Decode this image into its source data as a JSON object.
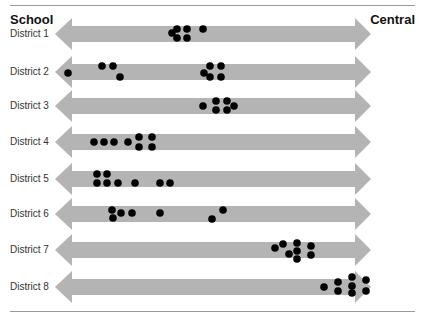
{
  "header": {
    "left_label": "School",
    "right_label": "Central"
  },
  "colors": {
    "arrow": "#b4b4b4",
    "dot": "#000000",
    "rule": "#9a9a9a"
  },
  "rows": [
    {
      "label": "District 1"
    },
    {
      "label": "District 2"
    },
    {
      "label": "District 3"
    },
    {
      "label": "District 4"
    },
    {
      "label": "District 5"
    },
    {
      "label": "District 6"
    },
    {
      "label": "District 7"
    },
    {
      "label": "District 8"
    }
  ],
  "chart_data": {
    "type": "scatter",
    "title": "",
    "xlabel": "School ← → Central",
    "ylabel": "",
    "axis_ends": {
      "left": "School",
      "right": "Central"
    },
    "categories": [
      "District 1",
      "District 2",
      "District 3",
      "District 4",
      "District 5",
      "District 6",
      "District 7",
      "District 8"
    ],
    "x_scale_note": "Position along School (0) to Central (100) continuum, estimated from pixel position",
    "series": [
      {
        "name": "District 1",
        "center_y": 34,
        "points": [
          [
            172,
            33
          ],
          [
            177,
            29
          ],
          [
            177,
            38
          ],
          [
            187,
            29
          ],
          [
            187,
            38
          ],
          [
            203,
            29
          ]
        ]
      },
      {
        "name": "District 2",
        "center_y": 72,
        "points": [
          [
            68,
            73
          ],
          [
            102,
            66
          ],
          [
            113,
            66
          ],
          [
            120,
            77
          ],
          [
            204,
            73
          ],
          [
            210,
            66
          ],
          [
            221,
            66
          ],
          [
            210,
            77
          ],
          [
            221,
            77
          ]
        ]
      },
      {
        "name": "District 3",
        "center_y": 106,
        "points": [
          [
            203,
            106
          ],
          [
            216,
            101
          ],
          [
            216,
            110
          ],
          [
            227,
            101
          ],
          [
            227,
            110
          ],
          [
            234,
            106
          ]
        ]
      },
      {
        "name": "District 4",
        "center_y": 142,
        "points": [
          [
            94,
            142
          ],
          [
            104,
            142
          ],
          [
            114,
            142
          ],
          [
            128,
            142
          ],
          [
            139,
            137
          ],
          [
            139,
            147
          ],
          [
            152,
            137
          ],
          [
            152,
            147
          ]
        ]
      },
      {
        "name": "District 5",
        "center_y": 179,
        "points": [
          [
            97,
            174
          ],
          [
            97,
            183
          ],
          [
            107,
            174
          ],
          [
            107,
            183
          ],
          [
            118,
            183
          ],
          [
            135,
            183
          ],
          [
            160,
            183
          ],
          [
            170,
            183
          ]
        ]
      },
      {
        "name": "District 6",
        "center_y": 214,
        "points": [
          [
            112,
            210
          ],
          [
            113,
            218
          ],
          [
            121,
            213
          ],
          [
            132,
            213
          ],
          [
            160,
            213
          ],
          [
            212,
            219
          ],
          [
            223,
            210
          ]
        ]
      },
      {
        "name": "District 7",
        "center_y": 250,
        "points": [
          [
            275,
            248
          ],
          [
            283,
            244
          ],
          [
            289,
            254
          ],
          [
            297,
            243
          ],
          [
            297,
            251
          ],
          [
            297,
            259
          ],
          [
            311,
            246
          ],
          [
            311,
            255
          ]
        ]
      },
      {
        "name": "District 8",
        "center_y": 287,
        "points": [
          [
            324,
            287
          ],
          [
            338,
            282
          ],
          [
            338,
            291
          ],
          [
            352,
            277
          ],
          [
            352,
            286
          ],
          [
            352,
            293
          ],
          [
            366,
            280
          ],
          [
            366,
            291
          ]
        ]
      }
    ],
    "point_counts": [
      6,
      9,
      6,
      8,
      8,
      7,
      8,
      8
    ],
    "legend": [],
    "grid": false
  }
}
